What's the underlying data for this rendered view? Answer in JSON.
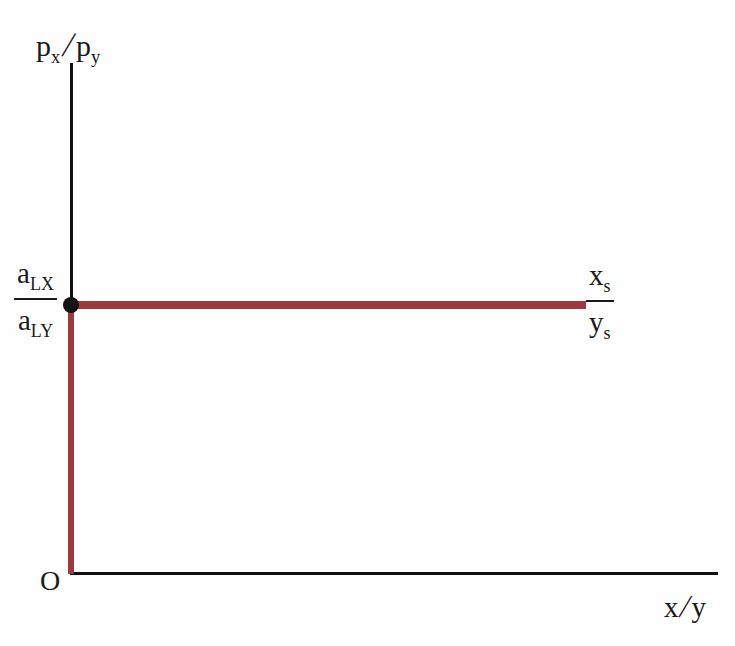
{
  "chart_data": {
    "type": "line",
    "title": "",
    "xlabel": "x/y",
    "ylabel": "p_x/p_y",
    "grid": false,
    "legend": "none",
    "axis_origin_label": "O",
    "xlim": [
      0,
      1
    ],
    "ylim": [
      0,
      1
    ],
    "series": [
      {
        "name": "relative supply",
        "color": "#9e3a3e",
        "points": [
          {
            "x": 0,
            "y": 0
          },
          {
            "x": 0,
            "y": 0.524
          },
          {
            "x": 0.795,
            "y": 0.524
          }
        ]
      }
    ],
    "markers": [
      {
        "name": "kink-point",
        "x": 0,
        "y": 0.524,
        "color": "#141414"
      }
    ],
    "annotations": [
      {
        "name": "y-intercept-value",
        "numerator": "a",
        "numerator_sub": "LX",
        "denominator": "a",
        "denominator_sub": "LY"
      },
      {
        "name": "curve-value",
        "numerator": "x",
        "numerator_sub": "s",
        "denominator": "y",
        "denominator_sub": "s"
      }
    ]
  },
  "axes": {
    "y_label": {
      "base1": "p",
      "sub1": "x",
      "slash": "/",
      "base2": "p",
      "sub2": "y"
    },
    "x_label": {
      "base1": "x",
      "slash": "/",
      "base2": "y"
    },
    "origin": "O",
    "line_color": "#111111"
  },
  "intercept_fraction": {
    "numerator_base": "a",
    "numerator_sub": "LX",
    "denominator_base": "a",
    "denominator_sub": "LY"
  },
  "supply_fraction": {
    "numerator_base": "x",
    "numerator_sub": "s",
    "denominator_base": "y",
    "denominator_sub": "s"
  },
  "colors": {
    "curve": "#9e3a3e",
    "axis": "#111111",
    "marker": "#141414",
    "background": "#fefefe"
  }
}
